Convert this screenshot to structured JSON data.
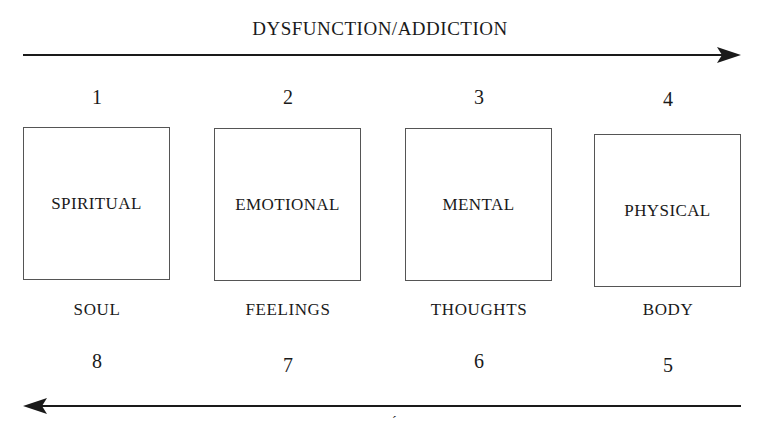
{
  "diagram": {
    "top_arrow": {
      "label": "DYSFUNCTION/ADDICTION",
      "direction": "right"
    },
    "bottom_arrow": {
      "direction": "left",
      "label_partial": "´"
    },
    "stages": [
      {
        "top_number": "1",
        "box_label": "SPIRITUAL",
        "sub_label": "SOUL",
        "bottom_number": "8"
      },
      {
        "top_number": "2",
        "box_label": "EMOTIONAL",
        "sub_label": "FEELINGS",
        "bottom_number": "7"
      },
      {
        "top_number": "3",
        "box_label": "MENTAL",
        "sub_label": "THOUGHTS",
        "bottom_number": "6"
      },
      {
        "top_number": "4",
        "box_label": "PHYSICAL",
        "sub_label": "BODY",
        "bottom_number": "5"
      }
    ],
    "colors": {
      "ink": "#1a1a1a",
      "box_border": "#555555",
      "background": "#ffffff"
    }
  }
}
